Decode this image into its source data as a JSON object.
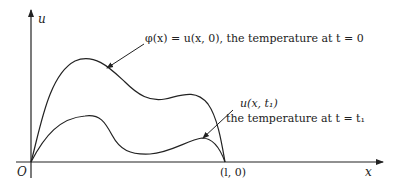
{
  "diagram": {
    "axes": {
      "y_label": "u",
      "x_label": "x",
      "origin_label": "O",
      "endpoint_label": "(l, 0)"
    },
    "curves": [
      {
        "name": "initial-temperature",
        "annotation": "φ(x) = u(x, 0), the temperature at t = 0"
      },
      {
        "name": "temperature-at-t1",
        "annotation_line1": "u(x, t₁)",
        "annotation_line2": "the temperature at t = t₁"
      }
    ],
    "colors": {
      "stroke": "#222222",
      "text": "#222222",
      "background": "#ffffff"
    }
  }
}
